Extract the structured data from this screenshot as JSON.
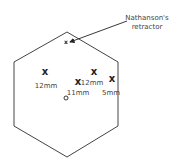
{
  "diagram": {
    "type": "laparoscopic port placement",
    "outline": {
      "shape": "hexagon",
      "stroke": "#444444",
      "points": [
        [
          67,
          32
        ],
        [
          118,
          62
        ],
        [
          118,
          126
        ],
        [
          67,
          157
        ],
        [
          14,
          126
        ],
        [
          14,
          62
        ]
      ]
    },
    "annotation": {
      "label_line1": "Nathanson's",
      "label_line2": "retractor",
      "arrow_from": [
        127,
        21
      ],
      "arrow_to": [
        70,
        42
      ]
    },
    "ports": [
      {
        "id": "retractor",
        "mark": "x",
        "size": "small",
        "x": 66,
        "y": 44,
        "label": ""
      },
      {
        "id": "left-12mm",
        "mark": "x",
        "size": "large",
        "x": 45,
        "y": 75,
        "label": "12mm",
        "label_x": 46,
        "label_y": 88
      },
      {
        "id": "center-11mm",
        "mark": "x",
        "size": "large",
        "x": 78,
        "y": 85,
        "label": "11mm",
        "label_x": 78,
        "label_y": 95
      },
      {
        "id": "right-12mm",
        "mark": "x",
        "size": "large",
        "x": 94,
        "y": 75,
        "label": "12mm",
        "label_x": 92,
        "label_y": 85
      },
      {
        "id": "far-right-5mm",
        "mark": "x",
        "size": "large",
        "x": 112,
        "y": 82,
        "label": "5mm",
        "label_x": 111,
        "label_y": 95
      }
    ],
    "umbilicus": {
      "mark": "o",
      "x": 66,
      "y": 98
    }
  }
}
